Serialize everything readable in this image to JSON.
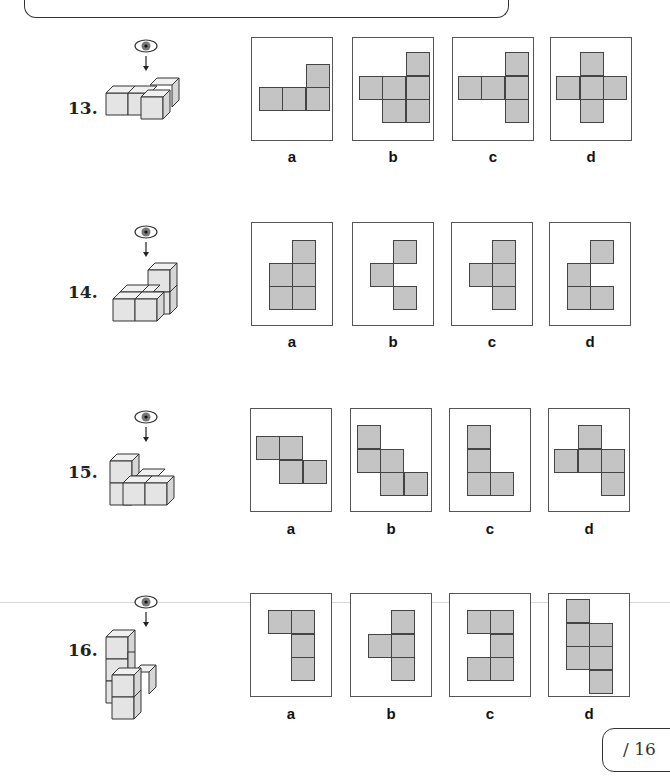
{
  "page": {
    "score_label": "/ 16",
    "colors": {
      "square_fill": "#c4c4c4",
      "square_border": "#444444",
      "box_border": "#555555"
    }
  },
  "questions": [
    {
      "number": "13.",
      "view_icon": "eye-top-view-icon",
      "options": [
        {
          "label": "a",
          "cells": [
            [
              2,
              0
            ],
            [
              0,
              1
            ],
            [
              1,
              1
            ],
            [
              2,
              1
            ]
          ]
        },
        {
          "label": "b",
          "cells": [
            [
              2,
              0
            ],
            [
              0,
              1
            ],
            [
              1,
              1
            ],
            [
              2,
              1
            ],
            [
              1,
              2
            ],
            [
              2,
              2
            ]
          ]
        },
        {
          "label": "c",
          "cells": [
            [
              2,
              0
            ],
            [
              0,
              1
            ],
            [
              1,
              1
            ],
            [
              2,
              1
            ],
            [
              2,
              2
            ]
          ]
        },
        {
          "label": "d",
          "cells": [
            [
              1,
              0
            ],
            [
              0,
              1
            ],
            [
              1,
              1
            ],
            [
              2,
              1
            ],
            [
              1,
              2
            ]
          ]
        }
      ]
    },
    {
      "number": "14.",
      "view_icon": "eye-top-view-icon",
      "options": [
        {
          "label": "a",
          "cells": [
            [
              1,
              0
            ],
            [
              0,
              1
            ],
            [
              1,
              1
            ],
            [
              0,
              2
            ],
            [
              1,
              2
            ]
          ]
        },
        {
          "label": "b",
          "cells": [
            [
              1,
              0
            ],
            [
              0,
              1
            ],
            [
              1,
              2
            ]
          ]
        },
        {
          "label": "c",
          "cells": [
            [
              1,
              0
            ],
            [
              0,
              1
            ],
            [
              1,
              1
            ],
            [
              1,
              2
            ]
          ]
        },
        {
          "label": "d",
          "cells": [
            [
              1,
              0
            ],
            [
              0,
              1
            ],
            [
              0,
              2
            ],
            [
              1,
              2
            ]
          ]
        }
      ]
    },
    {
      "number": "15.",
      "view_icon": "eye-top-view-icon",
      "options": [
        {
          "label": "a",
          "cells": [
            [
              0,
              0
            ],
            [
              1,
              0
            ],
            [
              1,
              1
            ],
            [
              2,
              1
            ]
          ]
        },
        {
          "label": "b",
          "cells": [
            [
              0,
              0
            ],
            [
              0,
              1
            ],
            [
              1,
              1
            ],
            [
              1,
              2
            ],
            [
              2,
              2
            ]
          ]
        },
        {
          "label": "c",
          "cells": [
            [
              0,
              0
            ],
            [
              0,
              1
            ],
            [
              0,
              2
            ],
            [
              1,
              2
            ]
          ]
        },
        {
          "label": "d",
          "cells": [
            [
              1,
              0
            ],
            [
              0,
              1
            ],
            [
              1,
              1
            ],
            [
              2,
              1
            ],
            [
              2,
              2
            ]
          ]
        }
      ]
    },
    {
      "number": "16.",
      "view_icon": "eye-top-view-icon",
      "options": [
        {
          "label": "a",
          "cells": [
            [
              0,
              0
            ],
            [
              1,
              0
            ],
            [
              1,
              1
            ],
            [
              1,
              2
            ]
          ]
        },
        {
          "label": "b",
          "cells": [
            [
              1,
              0
            ],
            [
              0,
              1
            ],
            [
              1,
              1
            ],
            [
              1,
              2
            ]
          ]
        },
        {
          "label": "c",
          "cells": [
            [
              0,
              0
            ],
            [
              1,
              0
            ],
            [
              1,
              1
            ],
            [
              0,
              2
            ],
            [
              1,
              2
            ]
          ]
        },
        {
          "label": "d",
          "cells": [
            [
              0,
              0
            ],
            [
              0,
              1
            ],
            [
              1,
              1
            ],
            [
              0,
              2
            ],
            [
              1,
              2
            ],
            [
              1,
              3
            ]
          ]
        }
      ]
    }
  ]
}
